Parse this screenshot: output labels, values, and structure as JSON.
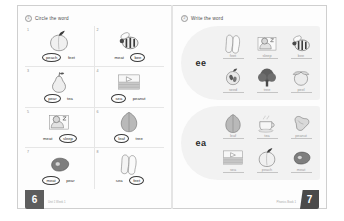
{
  "worksheet": {
    "left_page": {
      "page_number": "6",
      "footnote": "Unit 1 Week 1",
      "section": {
        "number": "1",
        "title": "Circle the word"
      },
      "items": [
        {
          "num": "1",
          "icon": "peach-icon",
          "choices": [
            {
              "text": "peach",
              "circled": true
            },
            {
              "text": "feet",
              "circled": false
            }
          ]
        },
        {
          "num": "2",
          "icon": "bee-icon",
          "choices": [
            {
              "text": "meat",
              "circled": false
            },
            {
              "text": "bee",
              "circled": true
            }
          ]
        },
        {
          "num": "3",
          "icon": "pear-icon",
          "choices": [
            {
              "text": "pear",
              "circled": true
            },
            {
              "text": "tea",
              "circled": false
            }
          ]
        },
        {
          "num": "4",
          "icon": "sea-icon",
          "choices": [
            {
              "text": "sea",
              "circled": true
            },
            {
              "text": "peanut",
              "circled": false
            }
          ]
        },
        {
          "num": "5",
          "icon": "sleep-icon",
          "choices": [
            {
              "text": "meat",
              "circled": false
            },
            {
              "text": "sleep",
              "circled": true
            }
          ]
        },
        {
          "num": "6",
          "icon": "leaf-icon",
          "choices": [
            {
              "text": "leaf",
              "circled": true
            },
            {
              "text": "tree",
              "circled": false
            }
          ]
        },
        {
          "num": "7",
          "icon": "meat-icon",
          "choices": [
            {
              "text": "meat",
              "circled": true
            },
            {
              "text": "pear",
              "circled": false
            }
          ]
        },
        {
          "num": "8",
          "icon": "feet-icon",
          "choices": [
            {
              "text": "sea",
              "circled": false
            },
            {
              "text": "feet",
              "circled": true
            }
          ]
        }
      ]
    },
    "right_page": {
      "page_number": "7",
      "footnote": "Phonics Book 1",
      "section": {
        "number": "2",
        "title": "Write the word"
      },
      "blocks": [
        {
          "label": "ee",
          "items": [
            {
              "icon": "feet-icon",
              "word": "feet"
            },
            {
              "icon": "sleep-icon",
              "word": "sleep"
            },
            {
              "icon": "bee-icon",
              "word": "bee"
            },
            {
              "icon": "seed-icon",
              "word": "seed"
            },
            {
              "icon": "tree-icon",
              "word": "tree"
            },
            {
              "icon": "peel-icon",
              "word": "peel"
            }
          ]
        },
        {
          "label": "ea",
          "items": [
            {
              "icon": "leaf-icon",
              "word": "leaf"
            },
            {
              "icon": "tea-icon",
              "word": "tea"
            },
            {
              "icon": "peanut-icon",
              "word": "peanut"
            },
            {
              "icon": "sea-icon",
              "word": "sea"
            },
            {
              "icon": "peach-icon",
              "word": "peach"
            },
            {
              "icon": "meat-icon",
              "word": "meat"
            }
          ]
        }
      ]
    }
  }
}
